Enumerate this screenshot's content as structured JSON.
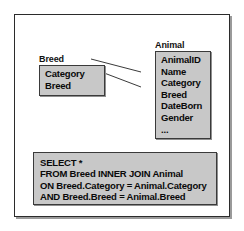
{
  "diagram": {
    "entities": [
      {
        "name": "breed",
        "label": "Breed",
        "fields": [
          "Category",
          "Breed"
        ]
      },
      {
        "name": "animal",
        "label": "Animal",
        "fields": [
          "AnimalID",
          "Name",
          "Category",
          "Breed",
          "DateBorn",
          "Gender",
          "..."
        ]
      }
    ],
    "relationships": [
      {
        "from": "Breed.Category",
        "to": "Animal.Category"
      },
      {
        "from": "Breed.Breed",
        "to": "Animal.Breed"
      }
    ],
    "sql": {
      "lines": [
        "SELECT *",
        "FROM Breed INNER JOIN Animal",
        "ON Breed.Category = Animal.Category",
        "AND Breed.Breed = Animal.Breed"
      ]
    },
    "colors": {
      "entity_fill": "#c8c8c8",
      "entity_border": "#3a3a3a",
      "panel_border": "#2b2b2b",
      "line": "#3a3a3a",
      "text": "#0a0a0a"
    }
  }
}
